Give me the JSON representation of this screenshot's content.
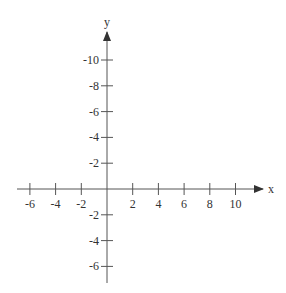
{
  "diagram": {
    "type": "cartesian-axes",
    "x_axis": {
      "label": "x",
      "ticks": [
        {
          "value": -6,
          "label": "-6"
        },
        {
          "value": -4,
          "label": "-4"
        },
        {
          "value": -2,
          "label": "-2"
        },
        {
          "value": 2,
          "label": "2"
        },
        {
          "value": 4,
          "label": "4"
        },
        {
          "value": 6,
          "label": "6"
        },
        {
          "value": 8,
          "label": "8"
        },
        {
          "value": 10,
          "label": "10"
        }
      ]
    },
    "y_axis": {
      "label": "y",
      "ticks_above": [
        {
          "pos": 2,
          "label": "-2"
        },
        {
          "pos": 4,
          "label": "-4"
        },
        {
          "pos": 6,
          "label": "-6"
        },
        {
          "pos": 8,
          "label": "-8"
        },
        {
          "pos": 10,
          "label": "-10"
        }
      ],
      "ticks_below": [
        {
          "pos": -2,
          "label": "-2"
        },
        {
          "pos": -4,
          "label": "-4"
        },
        {
          "pos": -6,
          "label": "-6"
        }
      ]
    },
    "colors": {
      "axis": "#555555",
      "text": "#333333"
    }
  }
}
